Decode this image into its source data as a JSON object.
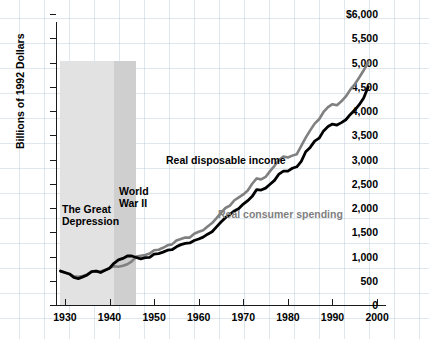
{
  "chart_data": {
    "type": "line",
    "title": "",
    "xlabel": "",
    "ylabel": "Billions of 1992 Dollars",
    "xlim": [
      1928,
      2002
    ],
    "ylim": [
      0,
      6000
    ],
    "grid": true,
    "legend_position": "inline-annotations",
    "y_ticks": [
      "$6,000",
      "5,500",
      "5,000",
      "4,500",
      "4,000",
      "3,500",
      "3,000",
      "2,500",
      "2,000",
      "1,500",
      "1,000",
      "500",
      "0"
    ],
    "y_tick_values": [
      6000,
      5500,
      5000,
      4500,
      4000,
      3500,
      3000,
      2500,
      2000,
      1500,
      1000,
      500,
      0
    ],
    "x_ticks": [
      "1930",
      "1940",
      "1950",
      "1960",
      "1970",
      "1980",
      "1990",
      "2000"
    ],
    "x_tick_values": [
      1930,
      1940,
      1950,
      1960,
      1970,
      1980,
      1990,
      2000
    ],
    "x": [
      1929,
      1930,
      1931,
      1932,
      1933,
      1934,
      1935,
      1936,
      1937,
      1938,
      1939,
      1940,
      1941,
      1942,
      1943,
      1944,
      1945,
      1946,
      1947,
      1948,
      1949,
      1950,
      1951,
      1952,
      1953,
      1954,
      1955,
      1956,
      1957,
      1958,
      1959,
      1960,
      1961,
      1962,
      1963,
      1964,
      1965,
      1966,
      1967,
      1968,
      1969,
      1970,
      1971,
      1972,
      1973,
      1974,
      1975,
      1976,
      1977,
      1978,
      1979,
      1980,
      1981,
      1982,
      1983,
      1984,
      1985,
      1986,
      1987,
      1988,
      1989,
      1990,
      1991,
      1992,
      1993,
      1994,
      1995,
      1996,
      1997,
      1998
    ],
    "series": [
      {
        "name": "Real disposable income",
        "color": "#000000",
        "values": [
          700,
          670,
          640,
          570,
          545,
          580,
          620,
          690,
          700,
          670,
          715,
          760,
          860,
          930,
          960,
          1010,
          1010,
          980,
          950,
          975,
          980,
          1050,
          1060,
          1090,
          1130,
          1140,
          1200,
          1245,
          1270,
          1280,
          1330,
          1360,
          1400,
          1460,
          1510,
          1610,
          1710,
          1800,
          1870,
          1940,
          1990,
          2080,
          2150,
          2240,
          2380,
          2370,
          2410,
          2490,
          2570,
          2700,
          2760,
          2760,
          2820,
          2850,
          2960,
          3160,
          3250,
          3380,
          3440,
          3590,
          3680,
          3730,
          3710,
          3760,
          3820,
          3930,
          4020,
          4130,
          4270,
          4500
        ]
      },
      {
        "name": "Real consumer spending",
        "color": "#808080",
        "values": [
          700,
          665,
          640,
          590,
          580,
          600,
          630,
          690,
          700,
          690,
          720,
          760,
          800,
          790,
          810,
          840,
          900,
          1000,
          1015,
          1030,
          1060,
          1130,
          1140,
          1180,
          1230,
          1250,
          1330,
          1360,
          1390,
          1390,
          1470,
          1510,
          1540,
          1620,
          1690,
          1790,
          1900,
          2000,
          2050,
          2160,
          2220,
          2280,
          2360,
          2500,
          2610,
          2590,
          2640,
          2760,
          2870,
          2990,
          3060,
          3040,
          3080,
          3110,
          3280,
          3450,
          3600,
          3740,
          3830,
          3980,
          4080,
          4140,
          4120,
          4200,
          4300,
          4440,
          4550,
          4690,
          4840,
          5000
        ]
      }
    ],
    "shaded_regions": [
      {
        "name": "The Great Depression",
        "label": "The Great\nDepression",
        "start": 1929,
        "end": 1941,
        "color": "#e2e2e2"
      },
      {
        "name": "World War II",
        "label": "World\nWar II",
        "start": 1941,
        "end": 1946,
        "color": "#cfcfcf"
      }
    ],
    "annotations": [
      {
        "name": "income-series-label",
        "text": "Real disposable income",
        "color": "#000000"
      },
      {
        "name": "spending-series-label",
        "text": "Real consumer spending",
        "color": "#808080"
      }
    ]
  }
}
